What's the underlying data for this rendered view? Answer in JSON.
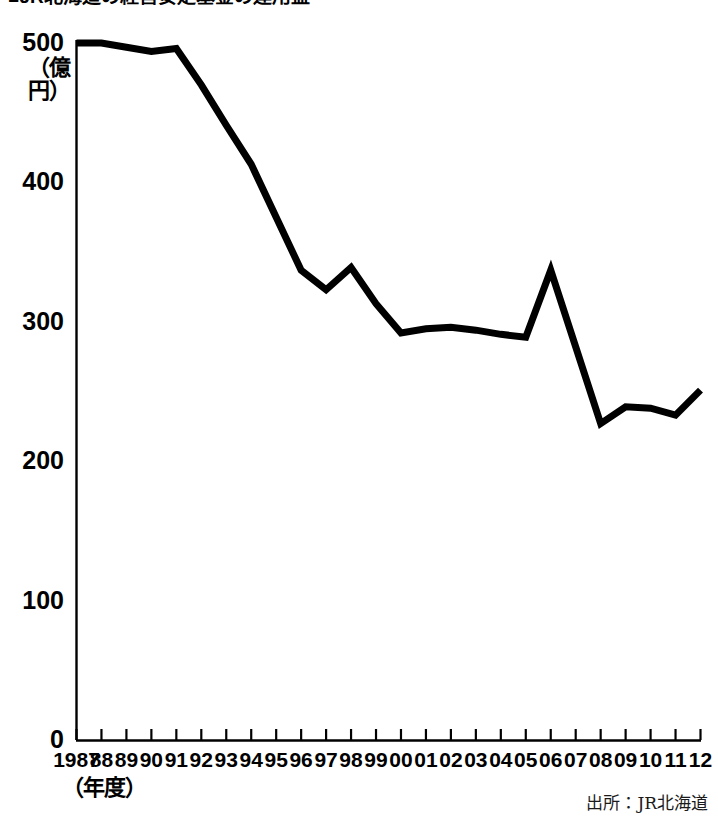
{
  "title": "■JR北海道の経営安定基金の運用益",
  "source_note": "出所：JR北海道",
  "axis": {
    "y_unit_label": "（億円）",
    "x_unit_label": "（年度）"
  },
  "chart_data": {
    "type": "line",
    "title": "■JR北海道の経営安定基金の運用益",
    "xlabel": "（年度）",
    "ylabel": "（億円）",
    "ylim": [
      0,
      500
    ],
    "y_ticks": [
      0,
      100,
      200,
      300,
      400,
      500
    ],
    "y_tick_labels": [
      "0",
      "100",
      "200",
      "300",
      "400",
      "500"
    ],
    "grid": false,
    "legend": false,
    "line_color": "#000000",
    "line_width": 7,
    "x": [
      1987,
      1988,
      1989,
      1990,
      1991,
      1992,
      1993,
      1994,
      1995,
      1996,
      1997,
      1998,
      1999,
      2000,
      2001,
      2002,
      2003,
      2004,
      2005,
      2006,
      2007,
      2008,
      2009,
      2010,
      2011,
      2012
    ],
    "categories": [
      "1987",
      "88",
      "89",
      "90",
      "91",
      "92",
      "93",
      "94",
      "95",
      "96",
      "97",
      "98",
      "99",
      "00",
      "01",
      "02",
      "03",
      "04",
      "05",
      "06",
      "07",
      "08",
      "09",
      "10",
      "11",
      "12"
    ],
    "values": [
      500,
      500,
      497,
      494,
      496,
      470,
      441,
      413,
      375,
      337,
      323,
      339,
      313,
      292,
      295,
      296,
      294,
      291,
      289,
      337,
      282,
      227,
      239,
      238,
      233,
      251
    ]
  }
}
